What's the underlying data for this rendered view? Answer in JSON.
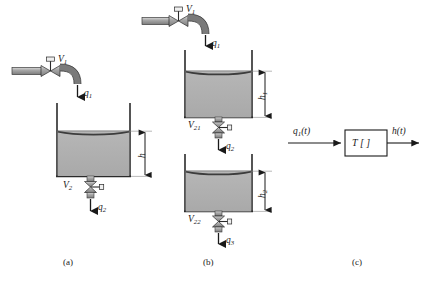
{
  "figure": {
    "panels": [
      {
        "id": "a",
        "caption": "(a)"
      },
      {
        "id": "b",
        "caption": "(b)"
      },
      {
        "id": "c",
        "caption": "(c)"
      }
    ]
  },
  "panel_a": {
    "inlet_valve_label": "V",
    "inlet_valve_sub": "1",
    "inflow_label": "q",
    "inflow_sub": "1",
    "height_label": "h",
    "outlet_valve_label": "V",
    "outlet_valve_sub": "2",
    "outflow_label": "q",
    "outflow_sub": "2"
  },
  "panel_b": {
    "inlet_valve_label": "V",
    "inlet_valve_sub": "1",
    "inflow_label": "q",
    "inflow_sub": "1",
    "tank1_height_label": "h",
    "tank1_height_sub": "1",
    "mid_valve_label": "V",
    "mid_valve_sub": "21",
    "mid_flow_label": "q",
    "mid_flow_sub": "2",
    "tank2_height_label": "h",
    "tank2_height_sub": "2",
    "outlet_valve_label": "V",
    "outlet_valve_sub": "22",
    "outflow_label": "q",
    "outflow_sub": "3"
  },
  "panel_c": {
    "input_label": "q",
    "input_sub": "1",
    "input_arg": "(t)",
    "block_label": "T [ ]",
    "output_label": "h",
    "output_arg": "(t)"
  },
  "colors": {
    "fluid": "#b0b0b0",
    "fluid_surface": "#3c3c3c",
    "tank_wall": "#2a2a2a",
    "pipe": "#9a9a9a",
    "ink": "#1a1a1a",
    "background": "#ffffff"
  }
}
